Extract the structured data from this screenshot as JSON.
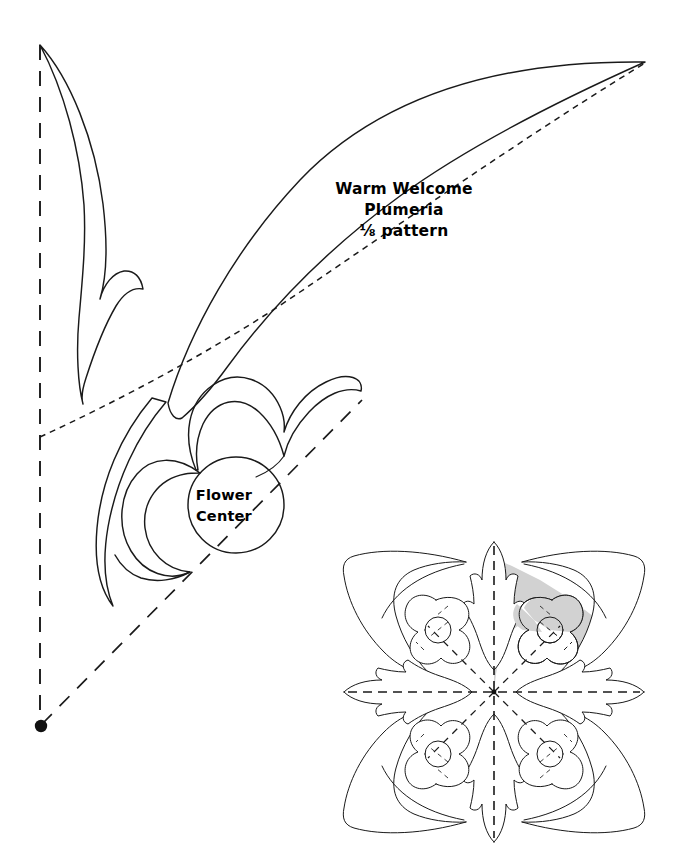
{
  "document": {
    "kind": "quilt-pattern-sheet",
    "title_lines": [
      "Warm Welcome",
      "Plumeria",
      "⅛ pattern"
    ],
    "title_line_1": "Warm Welcome",
    "title_line_2": "Plumeria",
    "title_line_3": "⅛ pattern",
    "center_label_line_1": "Flower",
    "center_label_line_2": "Center",
    "background_color": "#ffffff",
    "ink_color": "#1a1a1a",
    "shade_color": "#d2d2d2"
  },
  "large_pattern": {
    "name": "eighth-pattern-piece",
    "description": "One-eighth plumeria cut-pattern wedge with leaf, frond, stem, petals and flower center",
    "fold_line_vertical": "straight-grain fold",
    "fold_line_diagonal": "bias fold 45 degrees",
    "pivot_dot": "fold origin point",
    "leaf_vein": "dashed center vein"
  },
  "mini_diagram": {
    "name": "full-design-preview",
    "description": "Complete four-fold plumeria design showing the shaded one-eighth repeat",
    "shaded_wedge_label": "shaded one-eighth repeat",
    "flower_count": 4,
    "leaf_count": 4,
    "frond_count": 4,
    "fold_axes": [
      "vertical",
      "horizontal",
      "diagonal-ne",
      "diagonal-nw",
      "diagonal-se",
      "diagonal-sw"
    ],
    "shade_color": "#d2d2d2"
  }
}
